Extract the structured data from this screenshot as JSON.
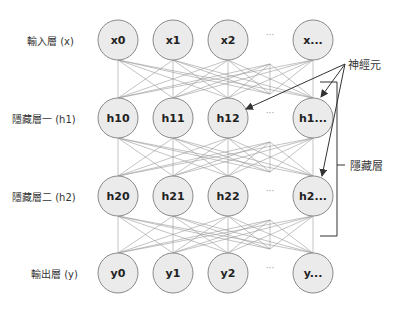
{
  "layers": [
    {
      "label": "輸入層 (x)",
      "nodes": [
        "x0",
        "x1",
        "x2",
        "x..."
      ]
    },
    {
      "label": "隱藏層一 (h1)",
      "nodes": [
        "h10",
        "h11",
        "h12",
        "h1..."
      ]
    },
    {
      "label": "隱藏層二 (h2)",
      "nodes": [
        "h20",
        "h21",
        "h22",
        "h2..."
      ]
    },
    {
      "label": "輸出層 (y)",
      "nodes": [
        "y0",
        "y1",
        "y2",
        "y..."
      ]
    }
  ],
  "ellipsis": "···",
  "annotations": {
    "neuron": "神經元",
    "hidden_layers": "隱藏層"
  },
  "colors": {
    "node_fill": "#ebebeb",
    "node_stroke": "#8a8a8a",
    "edge": "#9a9a9a",
    "arrow": "#333333"
  }
}
